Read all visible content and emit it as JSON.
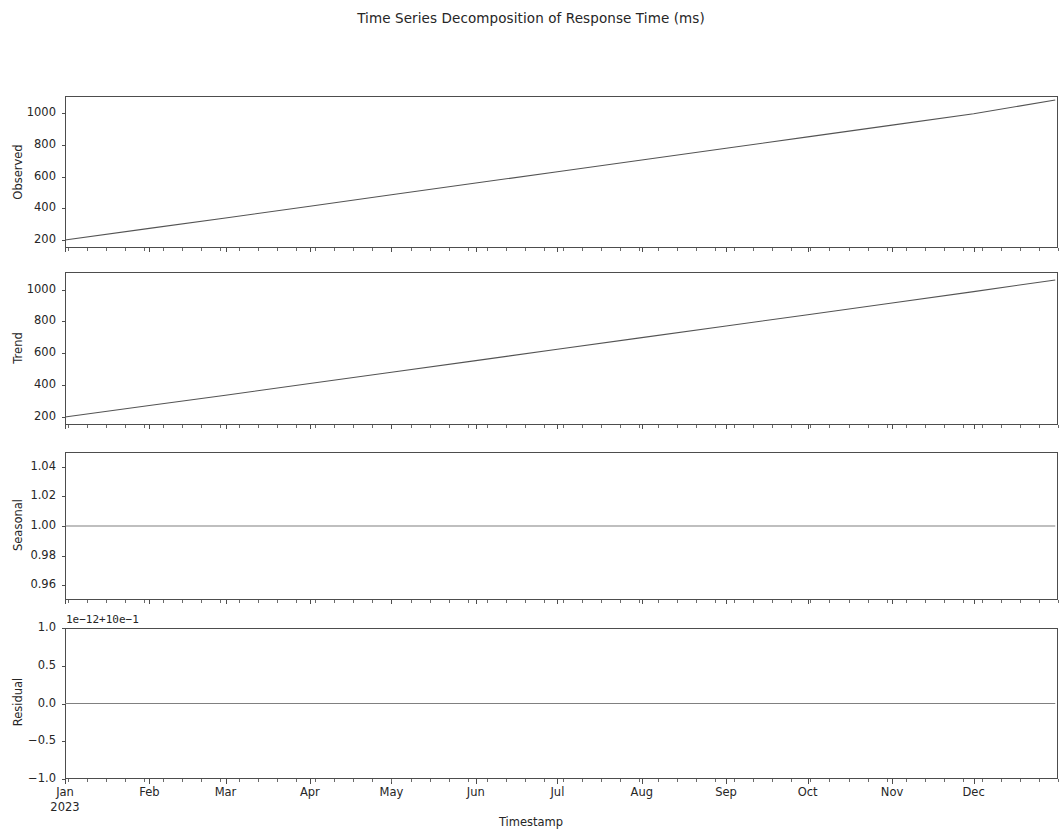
{
  "figure": {
    "title": "Time Series Decomposition of Response Time (ms)",
    "xlabel": "Timestamp",
    "line_color": "#545454",
    "axes_color": "#4d4d4d",
    "background": "#ffffff"
  },
  "panels": {
    "observed": {
      "ylabel": "Observed",
      "yticks": [
        "200",
        "400",
        "600",
        "800",
        "1000"
      ]
    },
    "trend": {
      "ylabel": "Trend",
      "yticks": [
        "200",
        "400",
        "600",
        "800",
        "1000"
      ]
    },
    "seasonal": {
      "ylabel": "Seasonal",
      "yticks": [
        "0.96",
        "0.98",
        "1.00",
        "1.02",
        "1.04"
      ]
    },
    "residual": {
      "ylabel": "Residual",
      "yticks": [
        "-1.0",
        "-0.5",
        "0.0",
        "0.5",
        "1.0"
      ],
      "offset_text": "1e−12+10e−1"
    }
  },
  "xaxis": {
    "ticks": [
      "Jan",
      "Feb",
      "Mar",
      "Apr",
      "May",
      "Jun",
      "Jul",
      "Aug",
      "Sep",
      "Oct",
      "Nov",
      "Dec"
    ],
    "year_sublabel": "2023"
  },
  "chart_data": {
    "type": "line",
    "title": "Time Series Decomposition of Response Time (ms)",
    "xlabel": "Timestamp",
    "grid": false,
    "legend": null,
    "x": [
      "2023-01-01",
      "2023-02-01",
      "2023-03-01",
      "2023-04-01",
      "2023-05-01",
      "2023-06-01",
      "2023-07-01",
      "2023-08-01",
      "2023-09-01",
      "2023-10-01",
      "2023-11-01",
      "2023-12-01",
      "2023-12-31"
    ],
    "subplots": [
      {
        "name": "Observed",
        "ylabel": "Observed",
        "type": "line",
        "ylim": [
          150,
          1110
        ],
        "yticks": [
          200,
          400,
          600,
          800,
          1000
        ],
        "values": [
          200,
          274,
          340,
          414,
          486,
          560,
          632,
          706,
          780,
          852,
          926,
          998,
          1085
        ]
      },
      {
        "name": "Trend",
        "ylabel": "Trend",
        "type": "line",
        "ylim": [
          150,
          1110
        ],
        "yticks": [
          200,
          400,
          600,
          800,
          1000
        ],
        "values": [
          200,
          272,
          337,
          410,
          481,
          554,
          625,
          698,
          771,
          842,
          915,
          987,
          1060
        ]
      },
      {
        "name": "Seasonal",
        "ylabel": "Seasonal",
        "type": "line",
        "ylim": [
          0.95,
          1.05
        ],
        "yticks": [
          0.96,
          0.98,
          1.0,
          1.02,
          1.04
        ],
        "values": [
          1.0,
          1.0,
          1.0,
          1.0,
          1.0,
          1.0,
          1.0,
          1.0,
          1.0,
          1.0,
          1.0,
          1.0,
          1.0
        ]
      },
      {
        "name": "Residual",
        "ylabel": "Residual",
        "type": "line",
        "ylim": [
          -1.0,
          1.0
        ],
        "yticks": [
          -1.0,
          -0.5,
          0.0,
          0.5,
          1.0
        ],
        "y_offset_text": "1e−12+10e−1",
        "values": [
          0.0,
          0.0,
          0.0,
          0.0,
          0.0,
          0.0,
          0.0,
          0.0,
          0.0,
          0.0,
          0.0,
          0.0,
          0.0
        ]
      }
    ]
  }
}
